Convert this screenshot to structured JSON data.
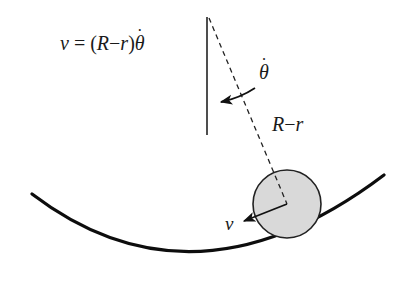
{
  "diagram": {
    "type": "physics-figure",
    "colors": {
      "stroke": "#111111",
      "ball_fill": "#d9d9d9",
      "background": "#ffffff"
    },
    "labels": {
      "equation": {
        "v": "v",
        "equals": " = (",
        "R": "R",
        "minus": "−",
        "r": "r",
        "close": ")",
        "theta": "θ",
        "dot": "˙"
      },
      "theta_dot": {
        "theta": "θ",
        "dot": "˙"
      },
      "radius_label": {
        "R": "R",
        "minus": "−",
        "r": "r"
      },
      "velocity_label": "v"
    },
    "elements": {
      "vertical_reference_line": {
        "x1": 207,
        "y1": 17,
        "x2": 207,
        "y2": 135
      },
      "radial_dashed_line": {
        "x1": 209,
        "y1": 18,
        "x2": 287,
        "y2": 204
      },
      "bowl_curve": {
        "start": [
          32,
          194
        ],
        "bottom": [
          195,
          256
        ],
        "end": [
          384,
          175
        ]
      },
      "ball": {
        "cx": 287,
        "cy": 204,
        "r": 34
      },
      "velocity_arrow": {
        "from": [
          287,
          204
        ],
        "to": [
          243,
          221
        ]
      },
      "angular_arrow": {
        "from": [
          255,
          88
        ],
        "to": [
          220,
          102
        ]
      }
    }
  }
}
